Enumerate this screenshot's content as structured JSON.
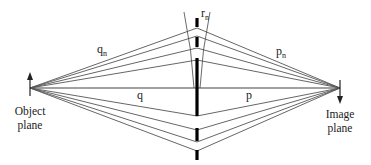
{
  "diagram": {
    "labels": {
      "rn": "r",
      "rn_sub": "n",
      "qn": "q",
      "qn_sub": "n",
      "pn": "p",
      "pn_sub": "n",
      "q": "q",
      "p": "p",
      "object_line1": "Object",
      "object_line2": "plane",
      "image_line1": "Image",
      "image_line2": "plane"
    },
    "geometry": {
      "object_point": [
        30,
        88
      ],
      "image_point": [
        340,
        88
      ],
      "plate_x": 197,
      "ray_hits_top": [
        28,
        36,
        48,
        60
      ],
      "ray_hits_bottom": [
        116,
        130,
        142,
        151
      ]
    },
    "colors": {
      "background": "#ffffff",
      "ray": "#555555",
      "zone": "#000000"
    }
  }
}
